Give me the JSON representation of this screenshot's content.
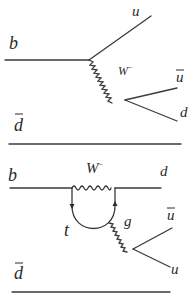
{
  "diagrams": [
    {
      "name": "tree-level",
      "labels": {
        "b": "b",
        "u_top": "u",
        "W": "W",
        "W_charge": "−",
        "ubar": "u",
        "d": "d",
        "dbar": "d"
      }
    },
    {
      "name": "penguin",
      "labels": {
        "b": "b",
        "W": "W",
        "W_charge": "−",
        "d": "d",
        "t": "t",
        "g": "g",
        "ubar": "u",
        "u": "u",
        "dbar": "d"
      }
    }
  ],
  "colors": {
    "line": "#3a3a3a",
    "text": "#2a2a2a",
    "background": "#ffffff"
  }
}
